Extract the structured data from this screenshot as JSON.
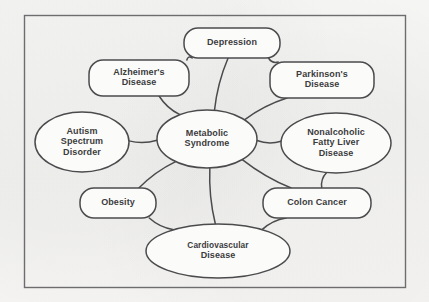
{
  "figure": {
    "frame_color": "#6d6d70",
    "node_stroke_color": "#4b4b4d",
    "node_fill_color": "#fbfbf9",
    "text_color": "#3c3c3e",
    "background_color": "#f4f4f2"
  },
  "nodes": [
    {
      "id": "depression",
      "label": "Depression",
      "lines": [
        "Depression"
      ],
      "shape": "rounded-rect",
      "cx": 232,
      "cy": 43,
      "rx": 48,
      "ry": 15
    },
    {
      "id": "alzheimers",
      "label": "Alzheimer's Disease",
      "lines": [
        "Alzheimer's",
        "Disease"
      ],
      "shape": "rounded-rect",
      "cx": 139,
      "cy": 78,
      "rx": 50,
      "ry": 18
    },
    {
      "id": "parkinsons",
      "label": "Parkinson's Disease",
      "lines": [
        "Parkinson's",
        "Disease"
      ],
      "shape": "rounded-rect",
      "cx": 322,
      "cy": 80,
      "rx": 52,
      "ry": 18
    },
    {
      "id": "autism",
      "label": "Autism Spectrum Disorder",
      "lines": [
        "Autism",
        "Spectrum",
        "Disorder"
      ],
      "shape": "ellipse",
      "cx": 82,
      "cy": 142,
      "rx": 47,
      "ry": 30
    },
    {
      "id": "metabolic-syndrome",
      "label": "Metabolic Syndrome",
      "lines": [
        "Metabolic",
        "Syndrome"
      ],
      "shape": "ellipse",
      "cx": 207,
      "cy": 139,
      "rx": 50,
      "ry": 29
    },
    {
      "id": "nafld",
      "label": "Nonalcoholic Fatty Liver Disease",
      "lines": [
        "Nonalcoholic",
        "Fatty Liver",
        "Disease"
      ],
      "shape": "ellipse",
      "cx": 336,
      "cy": 143,
      "rx": 55,
      "ry": 30
    },
    {
      "id": "obesity",
      "label": "Obesity",
      "lines": [
        "Obesity"
      ],
      "shape": "rounded-rect",
      "cx": 118,
      "cy": 203,
      "rx": 38,
      "ry": 15
    },
    {
      "id": "colon-cancer",
      "label": "Colon Cancer",
      "lines": [
        "Colon Cancer"
      ],
      "shape": "rounded-rect",
      "cx": 317,
      "cy": 203,
      "rx": 54,
      "ry": 15
    },
    {
      "id": "cardiovascular",
      "label": "Cardiovascular Disease",
      "lines": [
        "Cardiovascular",
        "Disease"
      ],
      "shape": "ellipse",
      "cx": 218,
      "cy": 251,
      "rx": 72,
      "ry": 27
    }
  ],
  "edges": [
    {
      "id": "edge-depression-alzheimers",
      "from": "depression",
      "to": "alzheimers"
    },
    {
      "id": "edge-depression-parkinsons",
      "from": "depression",
      "to": "parkinsons"
    },
    {
      "id": "edge-depression-metabolic",
      "from": "depression",
      "to": "metabolic-syndrome"
    },
    {
      "id": "edge-alzheimers-metabolic",
      "from": "alzheimers",
      "to": "metabolic-syndrome"
    },
    {
      "id": "edge-parkinsons-metabolic",
      "from": "parkinsons",
      "to": "metabolic-syndrome"
    },
    {
      "id": "edge-autism-metabolic",
      "from": "autism",
      "to": "metabolic-syndrome"
    },
    {
      "id": "edge-metabolic-nafld",
      "from": "metabolic-syndrome",
      "to": "nafld"
    },
    {
      "id": "edge-metabolic-obesity",
      "from": "metabolic-syndrome",
      "to": "obesity"
    },
    {
      "id": "edge-metabolic-colon",
      "from": "metabolic-syndrome",
      "to": "colon-cancer"
    },
    {
      "id": "edge-metabolic-cardiovascular",
      "from": "metabolic-syndrome",
      "to": "cardiovascular"
    },
    {
      "id": "edge-obesity-cardiovascular",
      "from": "obesity",
      "to": "cardiovascular"
    },
    {
      "id": "edge-colon-cardiovascular",
      "from": "colon-cancer",
      "to": "cardiovascular"
    },
    {
      "id": "edge-nafld-colon",
      "from": "nafld",
      "to": "colon-cancer"
    }
  ]
}
